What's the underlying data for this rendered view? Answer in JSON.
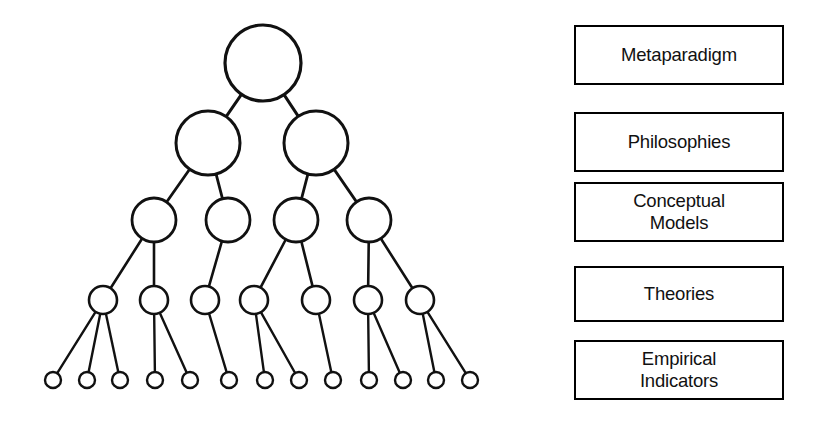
{
  "figure": {
    "background_color": "#ffffff",
    "stroke_color": "#111111"
  },
  "levels": [
    {
      "id": "metaparadigm",
      "label": "Metaparadigm",
      "node_count": 1,
      "node_radius": 38
    },
    {
      "id": "philosophies",
      "label": "Philosophies",
      "node_count": 2,
      "node_radius": 32
    },
    {
      "id": "conceptual-models",
      "label": "Conceptual\nModels",
      "node_count": 4,
      "node_radius": 22
    },
    {
      "id": "theories",
      "label": "Theories",
      "node_count": 7,
      "node_radius": 14
    },
    {
      "id": "empirical-indicators",
      "label": "Empirical\nIndicators",
      "node_count": 13,
      "node_radius": 8
    }
  ],
  "tree": {
    "nodes": [
      {
        "id": "n0",
        "level": 0,
        "cx": 263,
        "cy": 63,
        "r": 38
      },
      {
        "id": "n1a",
        "level": 1,
        "cx": 208,
        "cy": 143,
        "r": 32
      },
      {
        "id": "n1b",
        "level": 1,
        "cx": 316,
        "cy": 143,
        "r": 32
      },
      {
        "id": "n2a",
        "level": 2,
        "cx": 154,
        "cy": 220,
        "r": 22
      },
      {
        "id": "n2b",
        "level": 2,
        "cx": 228,
        "cy": 220,
        "r": 22
      },
      {
        "id": "n2c",
        "level": 2,
        "cx": 296,
        "cy": 220,
        "r": 22
      },
      {
        "id": "n2d",
        "level": 2,
        "cx": 369,
        "cy": 220,
        "r": 22
      },
      {
        "id": "n3a",
        "level": 3,
        "cx": 103,
        "cy": 300,
        "r": 14
      },
      {
        "id": "n3b",
        "level": 3,
        "cx": 154,
        "cy": 300,
        "r": 14
      },
      {
        "id": "n3c",
        "level": 3,
        "cx": 205,
        "cy": 300,
        "r": 14
      },
      {
        "id": "n3d",
        "level": 3,
        "cx": 254,
        "cy": 300,
        "r": 14
      },
      {
        "id": "n3e",
        "level": 3,
        "cx": 316,
        "cy": 300,
        "r": 14
      },
      {
        "id": "n3f",
        "level": 3,
        "cx": 368,
        "cy": 300,
        "r": 14
      },
      {
        "id": "n3g",
        "level": 3,
        "cx": 420,
        "cy": 300,
        "r": 14
      },
      {
        "id": "n4a",
        "level": 4,
        "cx": 53,
        "cy": 380,
        "r": 8
      },
      {
        "id": "n4b",
        "level": 4,
        "cx": 87,
        "cy": 380,
        "r": 8
      },
      {
        "id": "n4c",
        "level": 4,
        "cx": 120,
        "cy": 380,
        "r": 8
      },
      {
        "id": "n4d",
        "level": 4,
        "cx": 155,
        "cy": 380,
        "r": 8
      },
      {
        "id": "n4e",
        "level": 4,
        "cx": 190,
        "cy": 380,
        "r": 8
      },
      {
        "id": "n4f",
        "level": 4,
        "cx": 229,
        "cy": 380,
        "r": 8
      },
      {
        "id": "n4g",
        "level": 4,
        "cx": 265,
        "cy": 380,
        "r": 8
      },
      {
        "id": "n4h",
        "level": 4,
        "cx": 299,
        "cy": 380,
        "r": 8
      },
      {
        "id": "n4i",
        "level": 4,
        "cx": 333,
        "cy": 380,
        "r": 8
      },
      {
        "id": "n4j",
        "level": 4,
        "cx": 369,
        "cy": 380,
        "r": 8
      },
      {
        "id": "n4k",
        "level": 4,
        "cx": 403,
        "cy": 380,
        "r": 8
      },
      {
        "id": "n4l",
        "level": 4,
        "cx": 436,
        "cy": 380,
        "r": 8
      },
      {
        "id": "n4m",
        "level": 4,
        "cx": 470,
        "cy": 380,
        "r": 8
      }
    ],
    "edges": [
      [
        "n0",
        "n1a"
      ],
      [
        "n0",
        "n1b"
      ],
      [
        "n1a",
        "n2a"
      ],
      [
        "n1a",
        "n2b"
      ],
      [
        "n1b",
        "n2c"
      ],
      [
        "n1b",
        "n2d"
      ],
      [
        "n2a",
        "n3a"
      ],
      [
        "n2a",
        "n3b"
      ],
      [
        "n2b",
        "n3c"
      ],
      [
        "n2c",
        "n3d"
      ],
      [
        "n2c",
        "n3e"
      ],
      [
        "n2d",
        "n3f"
      ],
      [
        "n2d",
        "n3g"
      ],
      [
        "n3a",
        "n4a"
      ],
      [
        "n3a",
        "n4b"
      ],
      [
        "n3a",
        "n4c"
      ],
      [
        "n3b",
        "n4d"
      ],
      [
        "n3b",
        "n4e"
      ],
      [
        "n3c",
        "n4f"
      ],
      [
        "n3d",
        "n4g"
      ],
      [
        "n3d",
        "n4h"
      ],
      [
        "n3e",
        "n4i"
      ],
      [
        "n3f",
        "n4j"
      ],
      [
        "n3f",
        "n4k"
      ],
      [
        "n3g",
        "n4l"
      ],
      [
        "n3g",
        "n4m"
      ]
    ]
  }
}
